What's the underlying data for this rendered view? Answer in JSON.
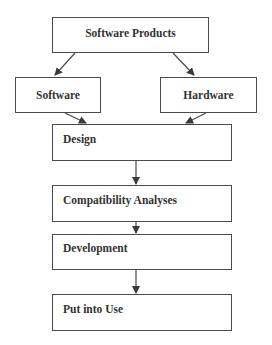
{
  "diagram": {
    "type": "flowchart",
    "nodes": [
      {
        "id": "software_products",
        "label": "Software Products"
      },
      {
        "id": "software",
        "label": "Software"
      },
      {
        "id": "hardware",
        "label": "Hardware"
      },
      {
        "id": "design",
        "label": "Design"
      },
      {
        "id": "compatibility_analyses",
        "label": "Compatibility Analyses"
      },
      {
        "id": "development",
        "label": "Development"
      },
      {
        "id": "put_into_use",
        "label": "Put into Use"
      }
    ],
    "edges": [
      {
        "from": "software_products",
        "to": "software"
      },
      {
        "from": "software_products",
        "to": "hardware"
      },
      {
        "from": "software",
        "to": "design"
      },
      {
        "from": "hardware",
        "to": "design"
      },
      {
        "from": "design",
        "to": "compatibility_analyses"
      },
      {
        "from": "compatibility_analyses",
        "to": "development"
      },
      {
        "from": "development",
        "to": "put_into_use"
      }
    ],
    "colors": {
      "stroke": "#4a4a4a",
      "text": "#333333",
      "background": "#ffffff"
    }
  }
}
